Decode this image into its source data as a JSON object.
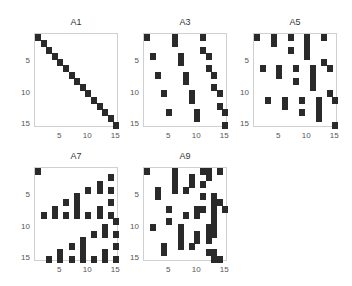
{
  "chart_data": [
    {
      "type": "heatmap",
      "title": "A1",
      "size": 15,
      "xticks": [
        5,
        10,
        15
      ],
      "yticks": [
        5,
        10,
        15
      ],
      "nonzeros": [
        [
          1,
          1
        ],
        [
          2,
          2
        ],
        [
          3,
          3
        ],
        [
          4,
          4
        ],
        [
          5,
          5
        ],
        [
          6,
          6
        ],
        [
          7,
          7
        ],
        [
          8,
          8
        ],
        [
          9,
          9
        ],
        [
          10,
          10
        ],
        [
          11,
          11
        ],
        [
          12,
          12
        ],
        [
          13,
          13
        ],
        [
          14,
          14
        ],
        [
          15,
          15
        ]
      ]
    },
    {
      "type": "heatmap",
      "title": "A3",
      "size": 15,
      "xticks": [
        5,
        10,
        15
      ],
      "yticks": [
        5,
        10,
        15
      ],
      "nonzeros": [
        [
          1,
          1
        ],
        [
          1,
          6
        ],
        [
          1,
          11
        ],
        [
          2,
          6
        ],
        [
          3,
          11
        ],
        [
          4,
          2
        ],
        [
          4,
          7
        ],
        [
          4,
          12
        ],
        [
          5,
          7
        ],
        [
          6,
          12
        ],
        [
          7,
          3
        ],
        [
          7,
          8
        ],
        [
          7,
          13
        ],
        [
          8,
          8
        ],
        [
          9,
          13
        ],
        [
          10,
          4
        ],
        [
          10,
          9
        ],
        [
          10,
          14
        ],
        [
          11,
          9
        ],
        [
          12,
          14
        ],
        [
          13,
          5
        ],
        [
          13,
          10
        ],
        [
          13,
          15
        ],
        [
          14,
          10
        ],
        [
          15,
          15
        ]
      ]
    },
    {
      "type": "heatmap",
      "title": "A5",
      "size": 15,
      "xticks": [
        5,
        10,
        15
      ],
      "yticks": [
        5,
        10,
        15
      ],
      "nonzeros": [
        [
          1,
          1
        ],
        [
          1,
          4
        ],
        [
          1,
          7
        ],
        [
          1,
          10
        ],
        [
          1,
          13
        ],
        [
          2,
          4
        ],
        [
          2,
          10
        ],
        [
          3,
          7
        ],
        [
          3,
          10
        ],
        [
          4,
          10
        ],
        [
          5,
          13
        ],
        [
          6,
          2
        ],
        [
          6,
          5
        ],
        [
          6,
          8
        ],
        [
          6,
          11
        ],
        [
          6,
          14
        ],
        [
          7,
          5
        ],
        [
          7,
          11
        ],
        [
          8,
          8
        ],
        [
          8,
          11
        ],
        [
          9,
          11
        ],
        [
          10,
          14
        ],
        [
          11,
          3
        ],
        [
          11,
          6
        ],
        [
          11,
          9
        ],
        [
          11,
          12
        ],
        [
          11,
          15
        ],
        [
          12,
          6
        ],
        [
          12,
          12
        ],
        [
          13,
          9
        ],
        [
          13,
          12
        ],
        [
          14,
          12
        ],
        [
          15,
          15
        ]
      ]
    },
    {
      "type": "heatmap",
      "title": "A7",
      "size": 15,
      "xticks": [
        5,
        10,
        15
      ],
      "yticks": [
        5,
        10,
        15
      ],
      "nonzeros": [
        [
          1,
          1
        ],
        [
          2,
          14
        ],
        [
          3,
          12
        ],
        [
          4,
          10
        ],
        [
          4,
          12
        ],
        [
          4,
          14
        ],
        [
          5,
          8
        ],
        [
          6,
          6
        ],
        [
          6,
          8
        ],
        [
          6,
          14
        ],
        [
          7,
          4
        ],
        [
          7,
          8
        ],
        [
          7,
          12
        ],
        [
          8,
          2
        ],
        [
          8,
          4
        ],
        [
          8,
          6
        ],
        [
          8,
          8
        ],
        [
          8,
          10
        ],
        [
          8,
          12
        ],
        [
          8,
          14
        ],
        [
          9,
          15
        ],
        [
          10,
          13
        ],
        [
          11,
          11
        ],
        [
          11,
          13
        ],
        [
          11,
          15
        ],
        [
          12,
          9
        ],
        [
          13,
          7
        ],
        [
          13,
          9
        ],
        [
          13,
          15
        ],
        [
          14,
          5
        ],
        [
          14,
          9
        ],
        [
          14,
          13
        ],
        [
          15,
          3
        ],
        [
          15,
          5
        ],
        [
          15,
          7
        ],
        [
          15,
          9
        ],
        [
          15,
          11
        ],
        [
          15,
          13
        ],
        [
          15,
          15
        ]
      ]
    },
    {
      "type": "heatmap",
      "title": "A9",
      "size": 15,
      "xticks": [
        5,
        10,
        15
      ],
      "yticks": [
        5,
        10,
        15
      ],
      "nonzeros": [
        [
          1,
          1
        ],
        [
          1,
          6
        ],
        [
          1,
          11
        ],
        [
          1,
          12
        ],
        [
          1,
          14
        ],
        [
          2,
          6
        ],
        [
          2,
          9
        ],
        [
          2,
          12
        ],
        [
          3,
          6
        ],
        [
          3,
          9
        ],
        [
          3,
          11
        ],
        [
          4,
          3
        ],
        [
          4,
          6
        ],
        [
          4,
          8
        ],
        [
          5,
          3
        ],
        [
          5,
          11
        ],
        [
          5,
          13
        ],
        [
          6,
          13
        ],
        [
          6,
          14
        ],
        [
          7,
          5
        ],
        [
          7,
          10
        ],
        [
          7,
          11
        ],
        [
          7,
          13
        ],
        [
          7,
          15
        ],
        [
          8,
          8
        ],
        [
          8,
          10
        ],
        [
          8,
          13
        ],
        [
          9,
          5
        ],
        [
          9,
          13
        ],
        [
          10,
          2
        ],
        [
          10,
          7
        ],
        [
          10,
          12
        ],
        [
          10,
          13
        ],
        [
          11,
          7
        ],
        [
          11,
          10
        ],
        [
          11,
          12
        ],
        [
          11,
          13
        ],
        [
          12,
          7
        ],
        [
          12,
          10
        ],
        [
          12,
          12
        ],
        [
          13,
          4
        ],
        [
          13,
          7
        ],
        [
          13,
          9
        ],
        [
          14,
          4
        ],
        [
          14,
          12
        ],
        [
          14,
          13
        ],
        [
          15,
          13
        ],
        [
          15,
          14
        ]
      ]
    }
  ],
  "panels": [
    {
      "title": "A1",
      "x": 34,
      "y": 33
    },
    {
      "title": "A3",
      "x": 143,
      "y": 33
    },
    {
      "title": "A5",
      "x": 253,
      "y": 33
    },
    {
      "title": "A7",
      "x": 34,
      "y": 167
    },
    {
      "title": "A9",
      "x": 143,
      "y": 167
    }
  ]
}
